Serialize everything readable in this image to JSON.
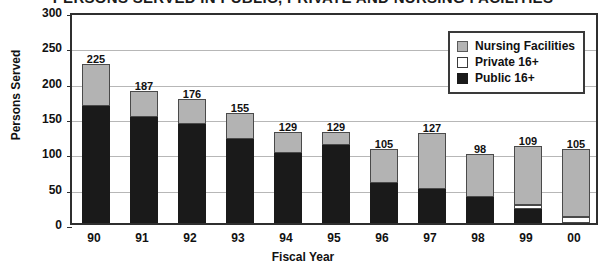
{
  "chart_data": {
    "type": "bar",
    "subtype": "stacked",
    "title": "PERSONS SERVED IN PUBLIC, PRIVATE AND NURSING FACILITIES",
    "title_clipped": true,
    "xlabel": "Fiscal Year",
    "ylabel": "Persons Served",
    "ylim": [
      0,
      300
    ],
    "yticks": [
      300,
      250,
      200,
      150,
      100,
      50,
      0
    ],
    "grid": true,
    "legend_position": "top-right",
    "categories": [
      "90",
      "91",
      "92",
      "93",
      "94",
      "95",
      "96",
      "97",
      "98",
      "99",
      "00"
    ],
    "totals": [
      225,
      187,
      176,
      155,
      129,
      129,
      105,
      127,
      98,
      109,
      105
    ],
    "series": [
      {
        "name": "Public 16+",
        "color": "#1a1a1a",
        "values": [
          165,
          150,
          140,
          119,
          99,
          110,
          57,
          48,
          37,
          20,
          0
        ]
      },
      {
        "name": "Private 16+",
        "color": "#ffffff",
        "values": [
          0,
          0,
          0,
          0,
          0,
          0,
          0,
          0,
          0,
          5,
          8
        ]
      },
      {
        "name": "Nursing Facilities",
        "color": "#b3b3b3",
        "values": [
          60,
          37,
          36,
          36,
          30,
          19,
          48,
          79,
          61,
          84,
          97
        ]
      }
    ],
    "data_labels": [
      "225",
      "187",
      "176",
      "155",
      "129",
      "129",
      "105",
      "127",
      "98",
      "109",
      "105"
    ]
  },
  "legend": {
    "items": [
      {
        "label": "Nursing Facilities",
        "swatch": "gray"
      },
      {
        "label": "Private 16+",
        "swatch": "white"
      },
      {
        "label": "Public 16+",
        "swatch": "black"
      }
    ]
  },
  "axes": {
    "y_title": "Persons Served",
    "x_title": "Fiscal Year",
    "y_tick_labels": [
      "300",
      "250",
      "200",
      "150",
      "100",
      "50",
      "0"
    ],
    "x_tick_labels": [
      "90",
      "91",
      "92",
      "93",
      "94",
      "95",
      "96",
      "97",
      "98",
      "99",
      "00"
    ]
  },
  "colors": {
    "nursing": "#b3b3b3",
    "private": "#ffffff",
    "public": "#1a1a1a",
    "axis": "#2f2f2f",
    "grid": "#b7b7b7",
    "text": "#111111"
  }
}
